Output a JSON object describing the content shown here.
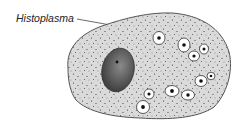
{
  "diagram": {
    "label": "Histoplasma",
    "colors": {
      "cytoplasm": "#d9d9d9",
      "outline": "#555555",
      "nucleus": "#5a5a5a",
      "organism_halo": "#ffffff",
      "organism_core": "#111111"
    }
  }
}
